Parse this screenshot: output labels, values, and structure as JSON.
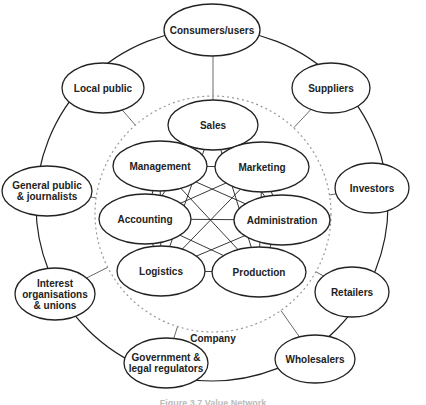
{
  "diagram": {
    "title": "Value Network",
    "caption": "Figure 3.7 Value Network",
    "company_label": "Company",
    "internal_nodes": [
      {
        "id": "sales",
        "label": [
          "Sales"
        ]
      },
      {
        "id": "marketing",
        "label": [
          "Marketing"
        ]
      },
      {
        "id": "administration",
        "label": [
          "Administration"
        ]
      },
      {
        "id": "production",
        "label": [
          "Production"
        ]
      },
      {
        "id": "logistics",
        "label": [
          "Logistics"
        ]
      },
      {
        "id": "accounting",
        "label": [
          "Accounting"
        ]
      },
      {
        "id": "management",
        "label": [
          "Management"
        ]
      }
    ],
    "external_nodes": [
      {
        "id": "consumers",
        "label": [
          "Consumers/users"
        ]
      },
      {
        "id": "suppliers",
        "label": [
          "Suppliers"
        ]
      },
      {
        "id": "investors",
        "label": [
          "Investors"
        ]
      },
      {
        "id": "retailers",
        "label": [
          "Retailers"
        ]
      },
      {
        "id": "wholesalers",
        "label": [
          "Wholesalers"
        ]
      },
      {
        "id": "government",
        "label": [
          "Government &",
          "legal regulators"
        ]
      },
      {
        "id": "interest",
        "label": [
          "Interest",
          "organisations",
          "& unions"
        ]
      },
      {
        "id": "general-public",
        "label": [
          "General public",
          "& journalists"
        ]
      },
      {
        "id": "local-public",
        "label": [
          "Local public"
        ]
      }
    ],
    "internal_connections": "all-to-all",
    "external_ring": "each external node connects to its neighbours on the outer ring and to the company boundary"
  }
}
